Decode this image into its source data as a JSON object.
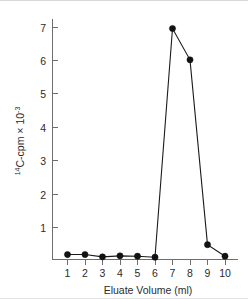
{
  "chart_data": {
    "type": "line",
    "title": "",
    "subtitle": "",
    "xlabel": "Eluate Volume (ml)",
    "ylabel": "14C-cpm x 10-3",
    "ylabel_parts": {
      "isotope_superscript": "14",
      "element": "C-cpm",
      "multiplier": "×",
      "base": "10",
      "exponent": "-3"
    },
    "x": [
      1,
      2,
      3,
      4,
      5,
      6,
      7,
      8,
      9,
      10
    ],
    "values": [
      0.15,
      0.15,
      0.08,
      0.11,
      0.1,
      0.07,
      7.0,
      6.05,
      0.45,
      0.1
    ],
    "series": [
      {
        "name": "14C-cpm",
        "values": [
          0.15,
          0.15,
          0.08,
          0.11,
          0.1,
          0.07,
          7.0,
          6.05,
          0.45,
          0.1
        ]
      }
    ],
    "xtick_labels": [
      "1",
      "2",
      "3",
      "4",
      "5",
      "6",
      "7",
      "8",
      "9",
      "10"
    ],
    "ytick_labels": [
      "1",
      "2",
      "3",
      "4",
      "5",
      "6",
      "7"
    ],
    "ytick_values": [
      1,
      2,
      3,
      4,
      5,
      6,
      7
    ],
    "xlim": [
      0.5,
      10.6
    ],
    "ylim": [
      0,
      7.5
    ],
    "grid": false,
    "legend": "none",
    "marker": "filled-circle",
    "line_color": "#1a1a1a",
    "marker_color": "#121212",
    "axis_color": "#6e6e6e",
    "background_color": "#ffffff"
  }
}
